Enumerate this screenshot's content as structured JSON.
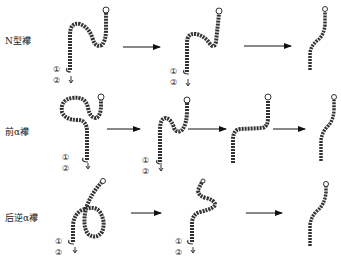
{
  "rows": [
    {
      "label": "N型襻",
      "steps": 3,
      "markers": [
        "①",
        "②"
      ]
    },
    {
      "label": "前α襻",
      "steps": 4,
      "markers": [
        "①",
        "②"
      ]
    },
    {
      "label": "后逆α襻",
      "steps": 3,
      "markers": [
        "①",
        "②"
      ]
    }
  ],
  "colors": {
    "tube": "#333333",
    "tube_highlight": "#bbbbbb",
    "arrow": "#111111",
    "background": "#ffffff"
  }
}
